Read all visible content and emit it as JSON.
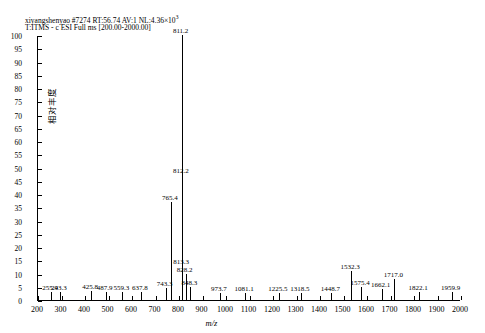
{
  "header": {
    "line1_pre": "xiyangshenyao #7274 RT:56.74 AV:1 NL:4.36×10",
    "line1_sup": "3",
    "line2": "T:ITMS - c ESI Full ms [200.00-2000.00]"
  },
  "chart_data": {
    "type": "bar",
    "subtitle": "T:ITMS - c ESI Full ms [200.00-2000.00]",
    "xlabel": "m/z",
    "ylabel": "相对丰度",
    "xlim": [
      200,
      2000
    ],
    "ylim": [
      0,
      100
    ],
    "xticks": [
      200,
      300,
      400,
      500,
      600,
      700,
      800,
      900,
      1000,
      1100,
      1200,
      1300,
      1400,
      1500,
      1600,
      1700,
      1800,
      1900,
      2000
    ],
    "yticks": [
      0,
      5,
      10,
      15,
      20,
      25,
      30,
      35,
      40,
      45,
      50,
      55,
      60,
      65,
      70,
      75,
      80,
      85,
      90,
      95,
      100
    ],
    "ytick_labels": [
      "0",
      "5",
      "10",
      "15",
      "20",
      "25",
      "30",
      "35",
      "40",
      "45",
      "50",
      "55",
      "60",
      "65",
      "70",
      "75",
      "80",
      "85",
      "90",
      "95",
      "100"
    ],
    "grid": false,
    "legend": "none",
    "peaks": [
      {
        "mz": 255.4,
        "intensity": 3.2,
        "label": "255.4"
      },
      {
        "mz": 293.3,
        "intensity": 3.0,
        "label": "293.3"
      },
      {
        "mz": 425.8,
        "intensity": 3.4,
        "label": "425.8"
      },
      {
        "mz": 487.9,
        "intensity": 3.0,
        "label": "487.9"
      },
      {
        "mz": 559.3,
        "intensity": 3.2,
        "label": "559.3"
      },
      {
        "mz": 637.8,
        "intensity": 3.0,
        "label": "637.8"
      },
      {
        "mz": 743.3,
        "intensity": 4.5,
        "label": "743.3"
      },
      {
        "mz": 765.4,
        "intensity": 37.0,
        "label": "765.4"
      },
      {
        "mz": 811.2,
        "intensity": 100.0,
        "label": "811.2"
      },
      {
        "mz": 812.2,
        "intensity": 47.0,
        "label": "812.2"
      },
      {
        "mz": 813.3,
        "intensity": 13.0,
        "label": "813.3"
      },
      {
        "mz": 828.2,
        "intensity": 10.0,
        "label": "828.2"
      },
      {
        "mz": 848.3,
        "intensity": 5.0,
        "label": "848.3"
      },
      {
        "mz": 973.7,
        "intensity": 2.8,
        "label": "973.7"
      },
      {
        "mz": 1081.1,
        "intensity": 2.8,
        "label": "1081.1"
      },
      {
        "mz": 1225.5,
        "intensity": 2.8,
        "label": "1225.5"
      },
      {
        "mz": 1318.5,
        "intensity": 2.8,
        "label": "1318.5"
      },
      {
        "mz": 1448.7,
        "intensity": 2.8,
        "label": "1448.7"
      },
      {
        "mz": 1532.3,
        "intensity": 11.0,
        "label": "1532.3"
      },
      {
        "mz": 1575.4,
        "intensity": 5.0,
        "label": "1575.4"
      },
      {
        "mz": 1662.1,
        "intensity": 4.0,
        "label": "1662.1"
      },
      {
        "mz": 1717.0,
        "intensity": 8.0,
        "label": "1717.0"
      },
      {
        "mz": 1822.1,
        "intensity": 3.2,
        "label": "1822.1"
      },
      {
        "mz": 1959.9,
        "intensity": 3.0,
        "label": "1959.9"
      }
    ]
  }
}
